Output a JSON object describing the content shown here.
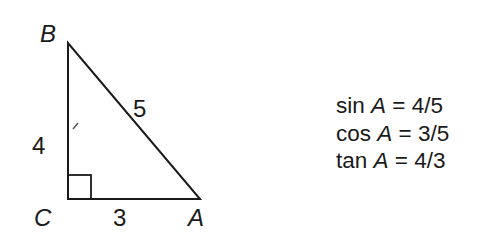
{
  "triangle": {
    "vertices": {
      "A": "A",
      "B": "B",
      "C": "C"
    },
    "sides": {
      "BC": "4",
      "CA": "3",
      "AB": "5"
    },
    "right_angle_at": "C",
    "line_color": "#1a1a1a"
  },
  "equations": [
    {
      "fn": "sin",
      "var": "A",
      "eq": "=",
      "value": "4/5"
    },
    {
      "fn": "cos",
      "var": "A",
      "eq": "=",
      "value": "3/5"
    },
    {
      "fn": "tan",
      "var": "A",
      "eq": "=",
      "value": "4/3"
    }
  ]
}
